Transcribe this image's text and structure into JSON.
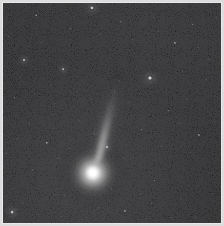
{
  "image": {
    "subject": "comet",
    "title": "Comet with coma and ion tail against star field",
    "width": 224,
    "height": 226,
    "frame_border_color": "#dcdcdc",
    "background_color": "#050505",
    "caption": ""
  },
  "comet": {
    "label": "comet-coma",
    "center_x": 93,
    "center_y": 173,
    "coma_radius": 30,
    "core_radius": 7,
    "peak_color": "#ffffff",
    "tail": {
      "label": "comet-tail",
      "start_x": 97,
      "start_y": 152,
      "end_x": 124,
      "end_y": 52,
      "angle_deg": 15,
      "length": 104,
      "color": "#b8b8b8"
    }
  },
  "chart_data": {
    "type": "scatter",
    "xlabel": "",
    "ylabel": "",
    "xlim": [
      0,
      218
    ],
    "ylim": [
      0,
      220
    ],
    "grid": false,
    "legend": "none",
    "series": [
      {
        "name": "bright-stars",
        "points": [
          {
            "x": 89,
            "y": 5,
            "r": 2.6,
            "b": 0.95
          },
          {
            "x": 147,
            "y": 75,
            "r": 3.0,
            "b": 1.0
          },
          {
            "x": 9,
            "y": 209,
            "r": 2.4,
            "b": 0.9
          },
          {
            "x": 104,
            "y": 144,
            "r": 2.0,
            "b": 0.82
          },
          {
            "x": 21,
            "y": 57,
            "r": 2.0,
            "b": 0.78
          },
          {
            "x": 60,
            "y": 66,
            "r": 1.8,
            "b": 0.72
          },
          {
            "x": 44,
            "y": 140,
            "r": 1.7,
            "b": 0.68
          },
          {
            "x": 172,
            "y": 40,
            "r": 1.6,
            "b": 0.66
          },
          {
            "x": 122,
            "y": 208,
            "r": 1.6,
            "b": 0.64
          },
          {
            "x": 196,
            "y": 132,
            "r": 1.5,
            "b": 0.62
          }
        ]
      },
      {
        "name": "medium-stars",
        "points": [
          {
            "x": 33,
            "y": 12,
            "r": 1.3,
            "b": 0.55
          },
          {
            "x": 68,
            "y": 26,
            "r": 1.2,
            "b": 0.5
          },
          {
            "x": 118,
            "y": 19,
            "r": 1.2,
            "b": 0.52
          },
          {
            "x": 151,
            "y": 14,
            "r": 1.1,
            "b": 0.46
          },
          {
            "x": 190,
            "y": 22,
            "r": 1.2,
            "b": 0.5
          },
          {
            "x": 206,
            "y": 57,
            "r": 1.1,
            "b": 0.45
          },
          {
            "x": 12,
            "y": 95,
            "r": 1.2,
            "b": 0.48
          },
          {
            "x": 52,
            "y": 101,
            "r": 1.1,
            "b": 0.44
          },
          {
            "x": 76,
            "y": 118,
            "r": 1.1,
            "b": 0.43
          },
          {
            "x": 166,
            "y": 108,
            "r": 1.2,
            "b": 0.5
          },
          {
            "x": 184,
            "y": 96,
            "r": 1.1,
            "b": 0.45
          },
          {
            "x": 139,
            "y": 127,
            "r": 1.2,
            "b": 0.47
          },
          {
            "x": 30,
            "y": 167,
            "r": 1.2,
            "b": 0.49
          },
          {
            "x": 62,
            "y": 193,
            "r": 1.1,
            "b": 0.44
          },
          {
            "x": 96,
            "y": 205,
            "r": 1.1,
            "b": 0.43
          },
          {
            "x": 152,
            "y": 178,
            "r": 1.2,
            "b": 0.46
          },
          {
            "x": 178,
            "y": 196,
            "r": 1.1,
            "b": 0.42
          },
          {
            "x": 207,
            "y": 170,
            "r": 1.1,
            "b": 0.44
          },
          {
            "x": 112,
            "y": 88,
            "r": 1.0,
            "b": 0.4
          },
          {
            "x": 134,
            "y": 63,
            "r": 1.0,
            "b": 0.4
          }
        ]
      },
      {
        "name": "faint-stars",
        "points": [
          {
            "x": 5,
            "y": 33,
            "r": 0.8,
            "b": 0.28
          },
          {
            "x": 17,
            "y": 74,
            "r": 0.8,
            "b": 0.26
          },
          {
            "x": 26,
            "y": 120,
            "r": 0.8,
            "b": 0.27
          },
          {
            "x": 38,
            "y": 39,
            "r": 0.8,
            "b": 0.25
          },
          {
            "x": 47,
            "y": 82,
            "r": 0.8,
            "b": 0.24
          },
          {
            "x": 55,
            "y": 155,
            "r": 0.8,
            "b": 0.29
          },
          {
            "x": 64,
            "y": 10,
            "r": 0.8,
            "b": 0.24
          },
          {
            "x": 72,
            "y": 179,
            "r": 0.8,
            "b": 0.27
          },
          {
            "x": 80,
            "y": 48,
            "r": 0.8,
            "b": 0.25
          },
          {
            "x": 88,
            "y": 96,
            "r": 0.8,
            "b": 0.23
          },
          {
            "x": 97,
            "y": 31,
            "r": 0.8,
            "b": 0.26
          },
          {
            "x": 105,
            "y": 66,
            "r": 0.8,
            "b": 0.24
          },
          {
            "x": 113,
            "y": 112,
            "r": 0.8,
            "b": 0.22
          },
          {
            "x": 121,
            "y": 155,
            "r": 0.8,
            "b": 0.28
          },
          {
            "x": 129,
            "y": 36,
            "r": 0.8,
            "b": 0.25
          },
          {
            "x": 137,
            "y": 190,
            "r": 0.8,
            "b": 0.26
          },
          {
            "x": 145,
            "y": 51,
            "r": 0.8,
            "b": 0.23
          },
          {
            "x": 158,
            "y": 143,
            "r": 0.8,
            "b": 0.27
          },
          {
            "x": 163,
            "y": 86,
            "r": 0.8,
            "b": 0.24
          },
          {
            "x": 171,
            "y": 163,
            "r": 0.8,
            "b": 0.25
          },
          {
            "x": 179,
            "y": 68,
            "r": 0.8,
            "b": 0.23
          },
          {
            "x": 187,
            "y": 149,
            "r": 0.8,
            "b": 0.26
          },
          {
            "x": 195,
            "y": 44,
            "r": 0.8,
            "b": 0.24
          },
          {
            "x": 201,
            "y": 105,
            "r": 0.8,
            "b": 0.25
          },
          {
            "x": 209,
            "y": 190,
            "r": 0.8,
            "b": 0.23
          },
          {
            "x": 213,
            "y": 14,
            "r": 0.8,
            "b": 0.26
          },
          {
            "x": 3,
            "y": 150,
            "r": 0.8,
            "b": 0.24
          },
          {
            "x": 10,
            "y": 185,
            "r": 0.8,
            "b": 0.25
          },
          {
            "x": 20,
            "y": 200,
            "r": 0.8,
            "b": 0.22
          },
          {
            "x": 35,
            "y": 211,
            "r": 0.8,
            "b": 0.24
          },
          {
            "x": 43,
            "y": 9,
            "r": 0.8,
            "b": 0.23
          },
          {
            "x": 50,
            "y": 125,
            "r": 0.8,
            "b": 0.22
          },
          {
            "x": 58,
            "y": 213,
            "r": 0.8,
            "b": 0.24
          },
          {
            "x": 83,
            "y": 214,
            "r": 0.8,
            "b": 0.23
          },
          {
            "x": 108,
            "y": 186,
            "r": 0.8,
            "b": 0.25
          },
          {
            "x": 116,
            "y": 77,
            "r": 0.8,
            "b": 0.22
          },
          {
            "x": 126,
            "y": 99,
            "r": 0.8,
            "b": 0.23
          },
          {
            "x": 143,
            "y": 215,
            "r": 0.8,
            "b": 0.24
          },
          {
            "x": 155,
            "y": 28,
            "r": 0.8,
            "b": 0.25
          },
          {
            "x": 168,
            "y": 214,
            "r": 0.8,
            "b": 0.22
          },
          {
            "x": 176,
            "y": 120,
            "r": 0.8,
            "b": 0.23
          },
          {
            "x": 192,
            "y": 214,
            "r": 0.8,
            "b": 0.24
          },
          {
            "x": 203,
            "y": 76,
            "r": 0.8,
            "b": 0.22
          },
          {
            "x": 212,
            "y": 118,
            "r": 0.8,
            "b": 0.23
          },
          {
            "x": 66,
            "y": 145,
            "r": 0.8,
            "b": 0.22
          },
          {
            "x": 74,
            "y": 88,
            "r": 0.8,
            "b": 0.21
          },
          {
            "x": 31,
            "y": 90,
            "r": 0.8,
            "b": 0.22
          },
          {
            "x": 91,
            "y": 130,
            "r": 0.8,
            "b": 0.21
          },
          {
            "x": 148,
            "y": 200,
            "r": 0.8,
            "b": 0.23
          },
          {
            "x": 14,
            "y": 135,
            "r": 0.8,
            "b": 0.22
          }
        ]
      },
      {
        "name": "comet-nucleus",
        "points": [
          {
            "x": 90,
            "y": 170,
            "r": 7.0,
            "b": 1.0
          }
        ]
      }
    ]
  }
}
